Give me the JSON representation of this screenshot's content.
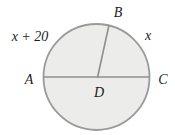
{
  "figure": {
    "type": "geometry-circle-diagram",
    "labels": {
      "point_a": "A",
      "point_b": "B",
      "point_c": "C",
      "point_d": "D",
      "arc_upper_left": "x + 20",
      "arc_upper_right": "x"
    },
    "colors": {
      "circle_fill": "#ececea",
      "circle_stroke": "#9a9a9a",
      "line": "#8f8f8f",
      "text": "#1c1c1c",
      "background": "#ffffff"
    }
  }
}
